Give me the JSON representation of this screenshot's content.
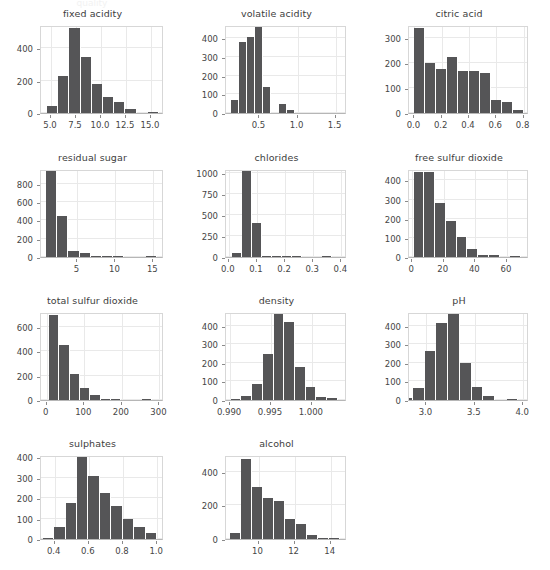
{
  "figure": {
    "title": "",
    "background_color": "#ffffff",
    "bar_color": "#555557",
    "grid_color": "#e9e9e9",
    "axis_color": "#b6b6b6",
    "text_color": "#454545",
    "columns": 3,
    "rows": 4,
    "ghost_top_text": "quality"
  },
  "chart_data": [
    {
      "type": "bar",
      "title": "fixed acidity",
      "xlabel": "",
      "ylabel": "",
      "grid": true,
      "xlim": [
        4.0,
        16.3
      ],
      "ylim": [
        0,
        545
      ],
      "xticks": [
        5.0,
        7.5,
        10.0,
        12.5,
        15.0
      ],
      "xtick_labels": [
        "5.0",
        "7.5",
        "10.0",
        "12.5",
        "15.0"
      ],
      "yticks": [
        0,
        200,
        400
      ],
      "ytick_labels": [
        "0",
        "200",
        "400"
      ],
      "bin_edges": [
        4.6,
        5.72,
        6.84,
        7.96,
        9.08,
        10.2,
        11.32,
        12.44,
        13.56,
        14.68,
        15.8
      ],
      "values": [
        43,
        229,
        524,
        345,
        182,
        100,
        71,
        24,
        0,
        8
      ]
    },
    {
      "type": "bar",
      "title": "volatile acidity",
      "xlabel": "",
      "ylabel": "",
      "grid": true,
      "xlim": [
        0.06,
        1.65
      ],
      "ylim": [
        0,
        470
      ],
      "xticks": [
        0.5,
        1.0,
        1.5
      ],
      "xtick_labels": [
        "0.5",
        "1.0",
        "1.5"
      ],
      "yticks": [
        0,
        100,
        200,
        300,
        400
      ],
      "ytick_labels": [
        "0",
        "100",
        "200",
        "300",
        "400"
      ],
      "bin_edges": [
        0.12,
        0.226,
        0.332,
        0.438,
        0.544,
        0.65,
        0.756,
        0.862,
        0.968,
        1.074,
        1.18
      ],
      "values": [
        68,
        381,
        408,
        459,
        140,
        0,
        50,
        16,
        0,
        0
      ]
    },
    {
      "type": "bar",
      "title": "citric acid",
      "xlabel": "",
      "ylabel": "",
      "grid": true,
      "xlim": [
        -0.04,
        0.84
      ],
      "ylim": [
        0,
        350
      ],
      "xticks": [
        0.0,
        0.2,
        0.4,
        0.6,
        0.8
      ],
      "xtick_labels": [
        "0.0",
        "0.2",
        "0.4",
        "0.6",
        "0.8"
      ],
      "yticks": [
        0,
        100,
        200,
        300
      ],
      "ytick_labels": [
        "0",
        "100",
        "200",
        "300"
      ],
      "bin_edges": [
        0.0,
        0.08,
        0.16,
        0.24,
        0.32,
        0.4,
        0.48,
        0.56,
        0.64,
        0.72,
        0.8
      ],
      "values": [
        339,
        198,
        176,
        223,
        169,
        167,
        160,
        53,
        45,
        13
      ]
    },
    {
      "type": "bar",
      "title": "residual sugar",
      "xlabel": "",
      "ylabel": "",
      "grid": true,
      "xlim": [
        0.2,
        16.4
      ],
      "ylim": [
        0,
        960
      ],
      "xticks": [
        5,
        10,
        15
      ],
      "xtick_labels": [
        "5",
        "10",
        "15"
      ],
      "yticks": [
        0,
        200,
        400,
        600,
        800
      ],
      "ytick_labels": [
        "0",
        "200",
        "400",
        "600",
        "800"
      ],
      "bin_edges": [
        0.9,
        2.36,
        3.82,
        5.28,
        6.74,
        8.2,
        9.66,
        11.12,
        12.58,
        14.04,
        15.5
      ],
      "values": [
        943,
        443,
        63,
        41,
        6,
        4,
        2,
        0,
        0,
        1
      ]
    },
    {
      "type": "bar",
      "title": "chlorides",
      "xlabel": "",
      "ylabel": "",
      "grid": true,
      "xlim": [
        -0.01,
        0.42
      ],
      "ylim": [
        0,
        1050
      ],
      "xticks": [
        0.0,
        0.1,
        0.2,
        0.3,
        0.4
      ],
      "xtick_labels": [
        "0.0",
        "0.1",
        "0.2",
        "0.3",
        "0.4"
      ],
      "yticks": [
        0,
        250,
        500,
        750,
        1000
      ],
      "ytick_labels": [
        "0",
        "250",
        "500",
        "750",
        "1000"
      ],
      "bin_edges": [
        0.012,
        0.0476,
        0.0832,
        0.1188,
        0.1544,
        0.19,
        0.2256,
        0.2612,
        0.2968,
        0.3324,
        0.368
      ],
      "values": [
        47,
        1030,
        408,
        17,
        12,
        12,
        4,
        0,
        0,
        1
      ]
    },
    {
      "type": "bar",
      "title": "free sulfur dioxide",
      "xlabel": "",
      "ylabel": "",
      "grid": true,
      "xlim": [
        -2,
        74
      ],
      "ylim": [
        0,
        460
      ],
      "xticks": [
        0,
        20,
        40,
        60
      ],
      "xtick_labels": [
        "0",
        "20",
        "40",
        "60"
      ],
      "yticks": [
        0,
        100,
        200,
        300,
        400
      ],
      "ytick_labels": [
        "0",
        "100",
        "200",
        "300",
        "400"
      ],
      "bin_edges": [
        1,
        7.8,
        14.6,
        21.4,
        28.2,
        35.0,
        41.8,
        48.6,
        55.4,
        62.2,
        69.0
      ],
      "values": [
        447,
        446,
        283,
        189,
        106,
        40,
        11,
        11,
        0,
        1
      ]
    },
    {
      "type": "bar",
      "title": "total sulfur dioxide",
      "xlabel": "",
      "ylabel": "",
      "grid": true,
      "xlim": [
        -15,
        312
      ],
      "ylim": [
        0,
        720
      ],
      "xticks": [
        0,
        100,
        200,
        300
      ],
      "xtick_labels": [
        "0",
        "100",
        "200",
        "300"
      ],
      "yticks": [
        0,
        200,
        400,
        600
      ],
      "ytick_labels": [
        "0",
        "200",
        "400",
        "600"
      ],
      "bin_edges": [
        6,
        33.5,
        61,
        88.5,
        116,
        143.5,
        171,
        198.5,
        226,
        253.5,
        281
      ],
      "values": [
        698,
        450,
        211,
        102,
        38,
        6,
        2,
        0,
        0,
        2
      ]
    },
    {
      "type": "bar",
      "title": "density",
      "xlabel": "",
      "ylabel": "",
      "grid": true,
      "xlim": [
        0.9895,
        1.0043
      ],
      "ylim": [
        0,
        475
      ],
      "xticks": [
        0.99,
        0.995,
        1.0
      ],
      "xtick_labels": [
        "0.990",
        "0.995",
        "1.000"
      ],
      "yticks": [
        0,
        100,
        200,
        300,
        400
      ],
      "ytick_labels": [
        "0",
        "100",
        "200",
        "300",
        "400"
      ],
      "bin_edges": [
        0.99007,
        0.991381,
        0.992692,
        0.994003,
        0.995314,
        0.996625,
        0.997936,
        0.999247,
        1.000558,
        1.001869,
        1.00318
      ],
      "values": [
        7,
        24,
        88,
        247,
        463,
        422,
        180,
        71,
        16,
        9
      ]
    },
    {
      "type": "bar",
      "title": "pH",
      "xlabel": "",
      "ylabel": "",
      "grid": true,
      "xlim": [
        2.82,
        4.06
      ],
      "ylim": [
        0,
        475
      ],
      "xticks": [
        3.0,
        3.5,
        4.0
      ],
      "xtick_labels": [
        "3.0",
        "3.5",
        "4.0"
      ],
      "yticks": [
        0,
        100,
        200,
        300,
        400
      ],
      "ytick_labels": [
        "0",
        "100",
        "200",
        "300",
        "400"
      ],
      "bin_edges": [
        2.74,
        2.861,
        2.982,
        3.103,
        3.224,
        3.345,
        3.466,
        3.587,
        3.708,
        3.829,
        3.95
      ],
      "values": [
        10,
        63,
        263,
        415,
        464,
        201,
        71,
        19,
        0,
        2
      ]
    },
    {
      "type": "bar",
      "title": "sulphates",
      "xlabel": "",
      "ylabel": "",
      "grid": true,
      "xlim": [
        0.32,
        1.04
      ],
      "ylim": [
        0,
        410
      ],
      "xticks": [
        0.4,
        0.6,
        0.8,
        1.0
      ],
      "xtick_labels": [
        "0.4",
        "0.6",
        "0.8",
        "1.0"
      ],
      "yticks": [
        0,
        100,
        200,
        300,
        400
      ],
      "ytick_labels": [
        "0",
        "100",
        "200",
        "300",
        "400"
      ],
      "bin_edges": [
        0.33,
        0.397,
        0.464,
        0.531,
        0.598,
        0.665,
        0.732,
        0.799,
        0.866,
        0.933,
        1.0
      ],
      "values": [
        5,
        59,
        176,
        401,
        308,
        224,
        163,
        97,
        59,
        29
      ]
    },
    {
      "type": "bar",
      "title": "alcohol",
      "xlabel": "",
      "ylabel": "",
      "grid": true,
      "xlim": [
        8.2,
        14.9
      ],
      "ylim": [
        0,
        500
      ],
      "xticks": [
        10,
        12,
        14
      ],
      "xtick_labels": [
        "10",
        "12",
        "14"
      ],
      "yticks": [
        0,
        200,
        400
      ],
      "ytick_labels": [
        "0",
        "200",
        "400"
      ],
      "bin_edges": [
        8.4,
        9.01,
        9.62,
        10.23,
        10.84,
        11.45,
        12.06,
        12.67,
        13.28,
        13.89,
        14.5
      ],
      "values": [
        35,
        478,
        307,
        243,
        224,
        117,
        87,
        22,
        3,
        1
      ]
    }
  ]
}
